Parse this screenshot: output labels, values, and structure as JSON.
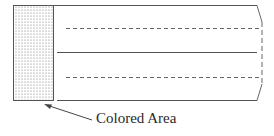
{
  "diagram": {
    "label": "Colored Area",
    "colors": {
      "stroke": "#555555",
      "dash": "#666666",
      "dots": "#777777",
      "text": "#2a2a2a"
    },
    "elements": [
      {
        "name": "colored-area",
        "type": "dotted-rectangle"
      },
      {
        "name": "top-edge",
        "type": "solid-line"
      },
      {
        "name": "dashed-line-1",
        "type": "dashed-line"
      },
      {
        "name": "middle-line",
        "type": "solid-line"
      },
      {
        "name": "dashed-line-2",
        "type": "dashed-line"
      },
      {
        "name": "bottom-edge",
        "type": "solid-line"
      },
      {
        "name": "torn-right-edge",
        "type": "broken-edge"
      },
      {
        "name": "pointer-arrow",
        "type": "arrow"
      }
    ]
  }
}
